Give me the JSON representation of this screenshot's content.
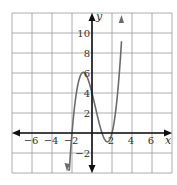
{
  "chart_data": {
    "type": "line",
    "title": "",
    "xlabel": "x",
    "ylabel": "y",
    "xlim": [
      -8,
      8
    ],
    "ylim": [
      -4,
      12
    ],
    "grid": true,
    "grid_step": 2,
    "x_ticks": [
      -6,
      -4,
      -2,
      2,
      4,
      6
    ],
    "x_tick_labels": [
      "−6",
      "−4",
      "−2",
      "2",
      "4",
      "6"
    ],
    "y_ticks": [
      -2,
      2,
      4,
      6,
      8,
      10
    ],
    "y_tick_labels": [
      "−2",
      "2",
      "4",
      "6",
      "8",
      "10"
    ],
    "function": "y = (x + 2)(x - 1)(x - 2)",
    "coefficients": [
      1,
      -1,
      -4,
      4
    ],
    "x_range": [
      -2.45,
      2.95
    ],
    "key_points": [
      {
        "x": -2,
        "y": 0,
        "label": "root"
      },
      {
        "x": -1,
        "y": 6,
        "label": "local max"
      },
      {
        "x": 0,
        "y": 4,
        "label": "y-intercept"
      },
      {
        "x": 1,
        "y": 0,
        "label": "root"
      },
      {
        "x": 1.5,
        "y": -0.875,
        "label": "local min"
      },
      {
        "x": 2,
        "y": 0,
        "label": "root"
      }
    ],
    "colors": {
      "grid": "#9a9a9a",
      "axes": "#111111",
      "curve": "#6b6b6b"
    }
  }
}
